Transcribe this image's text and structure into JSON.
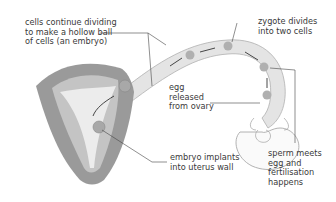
{
  "diagram": {
    "labels": {
      "cells_dividing": [
        "cells continue dividing",
        "to make a hollow ball",
        "of cells (an embryo)"
      ],
      "zygote_divides": [
        "zygote divides",
        "into two cells"
      ],
      "egg_released": [
        "egg",
        "released",
        "from ovary"
      ],
      "embryo_implants": [
        "embryo implants",
        "into uterus wall"
      ],
      "sperm_meets": [
        "sperm meets",
        "egg and",
        "fertilisation",
        "happens"
      ]
    },
    "colors": {
      "uterus_outer": "#9a9a9a",
      "uterus_lining": "#c4c4c4",
      "cavity": "#ececec",
      "tube": "#e4e4e4",
      "cell": "#a8a8a8",
      "leader_line": "#444444",
      "text": "#3a3a3a"
    }
  }
}
